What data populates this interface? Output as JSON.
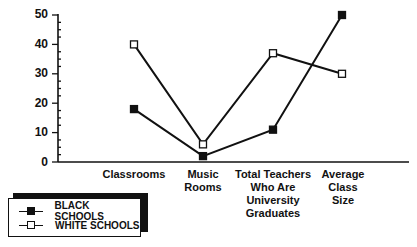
{
  "chart_data": {
    "type": "line",
    "title": "",
    "xlabel": "",
    "ylabel": "",
    "categories": [
      "Classrooms",
      "Music\nRooms",
      "Total Teachers\nWho Are\nUniversity\nGraduates",
      "Average\nClass\nSize"
    ],
    "series": [
      {
        "name": "BLACK SCHOOLS",
        "marker": "filled-square",
        "values": [
          18,
          2,
          11,
          50
        ]
      },
      {
        "name": "WHITE SCHOOLS",
        "marker": "open-square",
        "values": [
          40,
          6,
          37,
          30
        ]
      }
    ],
    "ylim": [
      0,
      50
    ],
    "yticks": [
      0,
      10,
      20,
      30,
      40,
      50
    ],
    "grid": false,
    "legend_position": "bottom-left"
  },
  "axis": {
    "y_tick_labels": [
      "50",
      "40",
      "30",
      "20",
      "10",
      "0"
    ]
  },
  "legend": {
    "items": [
      {
        "label": "BLACK SCHOOLS",
        "marker": "filled-square"
      },
      {
        "label": "WHITE SCHOOLS",
        "marker": "open-square"
      }
    ]
  },
  "colors": {
    "line": "#111111",
    "background": "#ffffff"
  }
}
